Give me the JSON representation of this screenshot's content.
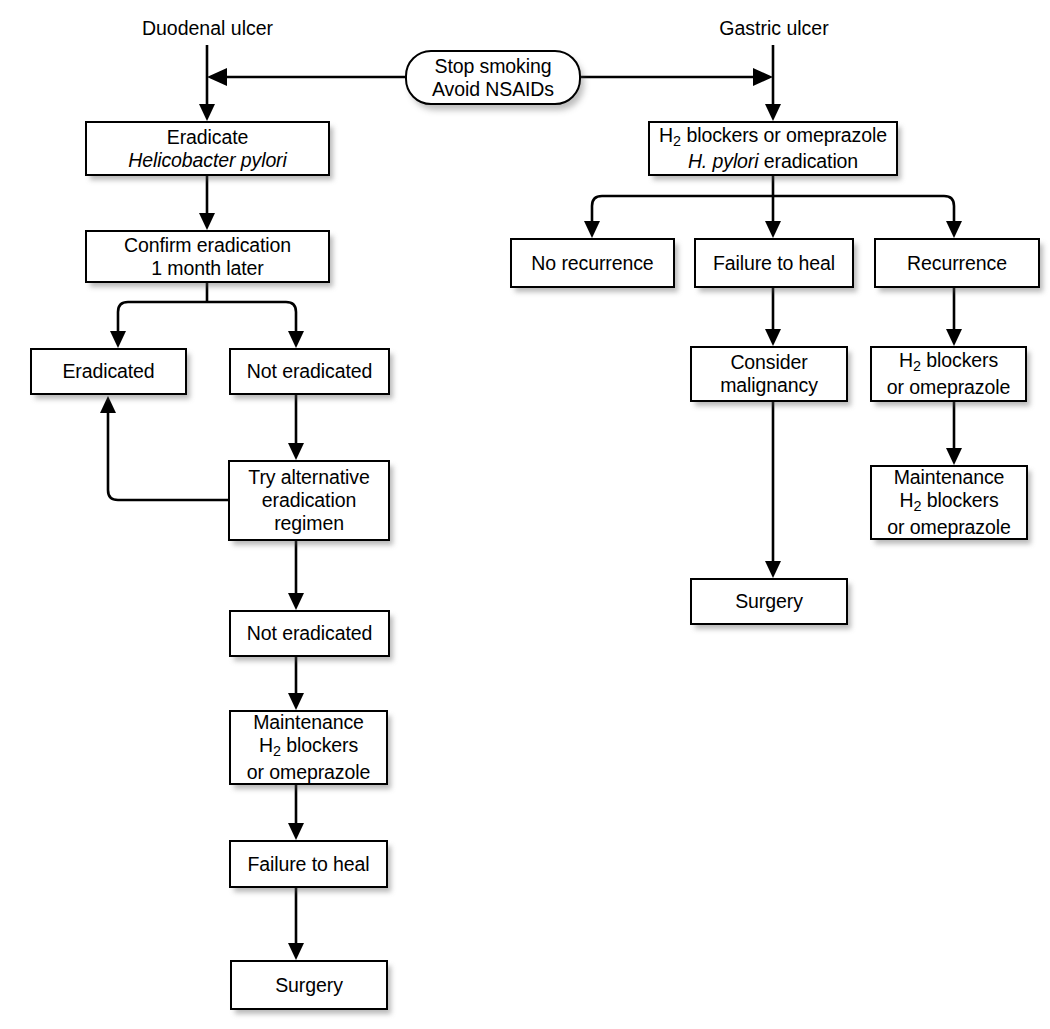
{
  "diagram": {
    "type": "flowchart",
    "background_color": "#ffffff",
    "line_color": "#000000",
    "box_fill": "#ffffff"
  },
  "captions": {
    "duodenal_ulcer": "Duodenal ulcer",
    "gastric_ulcer": "Gastric ulcer"
  },
  "shared": {
    "advice_line1": "Stop smoking",
    "advice_line2": "Avoid NSAIDs"
  },
  "left_branch": {
    "eradicate_line1": "Eradicate",
    "eradicate_line2": "Helicobacter pylori",
    "confirm_line1": "Confirm eradication",
    "confirm_line2": "1 month later",
    "eradicated": "Eradicated",
    "not_eradicated_1": "Not eradicated",
    "try_alt_line1": "Try alternative",
    "try_alt_line2": "eradication",
    "try_alt_line3": "regimen",
    "not_eradicated_2": "Not eradicated",
    "maintenance_line1": "Maintenance",
    "maintenance_line2_pre": "H",
    "maintenance_line2_sub": "2",
    "maintenance_line2_post": " blockers",
    "maintenance_line3": "or omeprazole",
    "failure_to_heal": "Failure to heal",
    "surgery": "Surgery"
  },
  "right_branch": {
    "first_line1_pre": "H",
    "first_line1_sub": "2",
    "first_line1_post": " blockers or omeprazole",
    "first_line2_italic": "H. pylori",
    "first_line2_rest": " eradication",
    "no_recurrence": "No recurrence",
    "failure_to_heal": "Failure to heal",
    "recurrence": "Recurrence",
    "consider_line1": "Consider",
    "consider_line2": "malignancy",
    "surgery": "Surgery",
    "h2_line1_pre": "H",
    "h2_line1_sub": "2",
    "h2_line1_post": " blockers",
    "h2_line2": "or omeprazole",
    "maintenance_line1": "Maintenance",
    "maintenance_line2_pre": "H",
    "maintenance_line2_sub": "2",
    "maintenance_line2_post": " blockers",
    "maintenance_line3": "or omeprazole"
  }
}
